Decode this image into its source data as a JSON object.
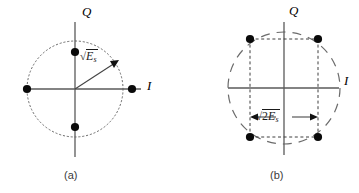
{
  "figure": {
    "width": 359,
    "height": 193,
    "background": "#ffffff",
    "stroke_color": "#555555",
    "dot_color": "#000000",
    "text_color": "#000000"
  },
  "panels": [
    {
      "id": "a",
      "caption": "(a)",
      "modulation": "BPSK-like 4-point circular constellation",
      "axes": {
        "horizontal_label": "I",
        "vertical_label": "Q"
      },
      "circle": {
        "center_x": 75,
        "center_y": 89,
        "radius": 48,
        "style": "dotted"
      },
      "points": [
        {
          "label": "",
          "x": 132,
          "y": 89
        },
        {
          "label": "",
          "x": 75,
          "y": 52
        },
        {
          "label": "",
          "x": 27,
          "y": 89
        },
        {
          "label": "",
          "x": 75,
          "y": 127
        }
      ],
      "vector": {
        "label_radix": "√",
        "label_radicand": "E",
        "label_subscript": "s",
        "from_x": 75,
        "from_y": 89,
        "to_x": 117,
        "to_y": 62,
        "arrowhead": true
      }
    },
    {
      "id": "b",
      "caption": "(b)",
      "modulation": "QPSK-like 4-point square constellation",
      "axes": {
        "horizontal_label": "I",
        "vertical_label": "Q"
      },
      "circle": {
        "center_x": 284,
        "center_y": 88,
        "radius": 56,
        "style": "dashed"
      },
      "points": [
        {
          "label": "",
          "x": 250,
          "y": 39
        },
        {
          "label": "",
          "x": 318,
          "y": 39
        },
        {
          "label": "",
          "x": 250,
          "y": 137
        },
        {
          "label": "",
          "x": 318,
          "y": 137
        }
      ],
      "square": {
        "left": 250,
        "right": 318,
        "top": 39,
        "bottom": 137,
        "style": "dashed"
      },
      "dimension": {
        "label_radix": "√",
        "label_number": "2",
        "label_radicand": "E",
        "label_subscript": "s",
        "from_x": 250,
        "to_x": 318,
        "y": 117,
        "double_headed": true
      }
    }
  ]
}
